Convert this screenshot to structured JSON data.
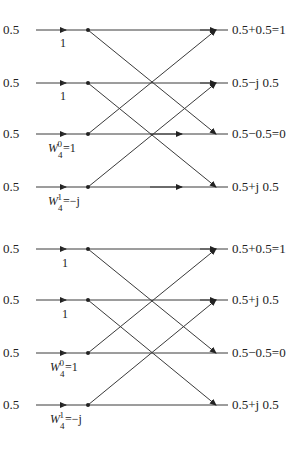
{
  "colors": {
    "line": "#3a3a3a",
    "text": "#222222",
    "background": "#ffffff"
  },
  "diagram": {
    "butterflies": [
      {
        "name": "top",
        "inputs": [
          "0.5",
          "0.5",
          "0.5",
          "0.5"
        ],
        "twiddles": [
          {
            "label": "1"
          },
          {
            "label": "1"
          },
          {
            "base": "W",
            "sup": "0",
            "sub": "4",
            "eq": "=1"
          },
          {
            "base": "W",
            "sup": "1",
            "sub": "4",
            "eq": "=−j"
          }
        ],
        "outputs": [
          "0.5+0.5=1",
          "0.5−j 0.5",
          "0.5−0.5=0",
          "0.5+j 0.5"
        ]
      },
      {
        "name": "bottom",
        "inputs": [
          "0.5",
          "0.5",
          "0.5",
          "0.5"
        ],
        "twiddles": [
          {
            "label": "1"
          },
          {
            "label": "1"
          },
          {
            "base": "W",
            "sup": "0",
            "sub": "4",
            "eq": "=1"
          },
          {
            "base": "W",
            "sup": "1",
            "sub": "4",
            "eq": "=−j"
          }
        ],
        "outputs": [
          "0.5+0.5=1",
          "0.5+j 0.5",
          "0.5−0.5=0",
          "0.5+j 0.5"
        ]
      }
    ]
  }
}
